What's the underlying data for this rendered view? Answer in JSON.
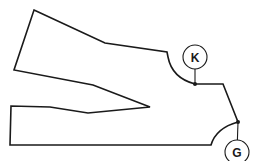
{
  "diagram": {
    "type": "pattern-piece-outline",
    "colors": {
      "stroke": "#1a1a1a",
      "background": "#ffffff",
      "label_fill": "#ffffff"
    },
    "labels": [
      {
        "id": "K",
        "text": "K",
        "cx": 195,
        "cy": 57,
        "r": 12,
        "point": [
          195,
          84
        ]
      },
      {
        "id": "G",
        "text": "G",
        "cx": 237,
        "cy": 152,
        "r": 12,
        "point": [
          238,
          122
        ]
      }
    ],
    "outline_path": "M34,10 L105,43 L167,52 L168,57 Q172,78 195,84 L223,84 L238,122 Q216,128 211,145 L10,145 L11,106 L50,107 L88,113 L150,107 L93,85 L14,70 Z"
  }
}
